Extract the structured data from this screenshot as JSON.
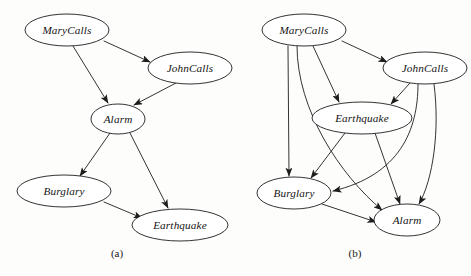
{
  "figure": {
    "background_color": "#fdfdfc",
    "stroke_color": "#1d1d1d",
    "text_color": "#141414",
    "node_fill": "#ffffff"
  },
  "panels": [
    {
      "id": "panel-a",
      "caption": "(a)",
      "caption_pos": {
        "x": 117,
        "y": 254
      },
      "nodes": [
        {
          "id": "marycalls",
          "label": "MaryCalls",
          "cx": 67,
          "cy": 30,
          "rx": 42,
          "ry": 16
        },
        {
          "id": "johncalls",
          "label": "JohnCalls",
          "cx": 190,
          "cy": 68,
          "rx": 42,
          "ry": 16
        },
        {
          "id": "alarm",
          "label": "Alarm",
          "cx": 118,
          "cy": 119,
          "rx": 27,
          "ry": 15
        },
        {
          "id": "burglary",
          "label": "Burglary",
          "cx": 64,
          "cy": 191,
          "rx": 47,
          "ry": 16
        },
        {
          "id": "earthquake",
          "label": "Earthquake",
          "cx": 180,
          "cy": 225,
          "rx": 48,
          "ry": 16
        }
      ],
      "edges": [
        {
          "id": "a-mary-john",
          "from": "MaryCalls",
          "to": "JohnCalls",
          "curved": false
        },
        {
          "id": "a-mary-alarm",
          "from": "MaryCalls",
          "to": "Alarm",
          "curved": false
        },
        {
          "id": "a-john-alarm",
          "from": "JohnCalls",
          "to": "Alarm",
          "curved": false
        },
        {
          "id": "a-alarm-burg",
          "from": "Alarm",
          "to": "Burglary",
          "curved": false
        },
        {
          "id": "a-alarm-eq",
          "from": "Alarm",
          "to": "Earthquake",
          "curved": false
        },
        {
          "id": "a-burg-eq",
          "from": "Burglary",
          "to": "Earthquake",
          "curved": false
        }
      ]
    },
    {
      "id": "panel-b",
      "caption": "(b)",
      "caption_pos": {
        "x": 355,
        "y": 254
      },
      "nodes": [
        {
          "id": "b-marycalls",
          "label": "MaryCalls",
          "cx": 304,
          "cy": 30,
          "rx": 42,
          "ry": 16
        },
        {
          "id": "b-johncalls",
          "label": "JohnCalls",
          "cx": 425,
          "cy": 68,
          "rx": 42,
          "ry": 16
        },
        {
          "id": "b-earthquake",
          "label": "Earthquake",
          "cx": 362,
          "cy": 118,
          "rx": 50,
          "ry": 16
        },
        {
          "id": "b-burglary",
          "label": "Burglary",
          "cx": 294,
          "cy": 193,
          "rx": 37,
          "ry": 16
        },
        {
          "id": "b-alarm",
          "label": "Alarm",
          "cx": 407,
          "cy": 220,
          "rx": 33,
          "ry": 16
        }
      ],
      "edges": [
        {
          "id": "b-mary-john",
          "from": "MaryCalls",
          "to": "JohnCalls",
          "curved": false
        },
        {
          "id": "b-mary-eq",
          "from": "MaryCalls",
          "to": "Earthquake",
          "curved": false
        },
        {
          "id": "b-mary-burg",
          "from": "MaryCalls",
          "to": "Burglary",
          "curved": false
        },
        {
          "id": "b-mary-alarm",
          "from": "MaryCalls",
          "to": "Alarm",
          "curved": true
        },
        {
          "id": "b-john-eq",
          "from": "JohnCalls",
          "to": "Earthquake",
          "curved": false
        },
        {
          "id": "b-john-burg",
          "from": "JohnCalls",
          "to": "Burglary",
          "curved": true
        },
        {
          "id": "b-john-alarm",
          "from": "JohnCalls",
          "to": "Alarm",
          "curved": true
        },
        {
          "id": "b-eq-burg",
          "from": "Earthquake",
          "to": "Burglary",
          "curved": false
        },
        {
          "id": "b-eq-alarm",
          "from": "Earthquake",
          "to": "Alarm",
          "curved": false
        },
        {
          "id": "b-burg-alarm",
          "from": "Burglary",
          "to": "Alarm",
          "curved": false
        }
      ]
    }
  ]
}
